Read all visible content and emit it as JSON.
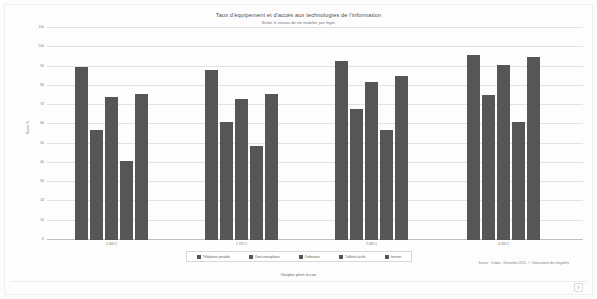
{
  "document": {
    "corner_mark_left": "·",
    "corner_mark_right": "·",
    "caption": "Graphe plein écran",
    "page_badge": "8"
  },
  "chart_data": {
    "type": "bar",
    "title": "Taux d'équipement et d'accès aux technologies de l'information",
    "subtitle": "Selon le niveau de vie mobilier par foyer",
    "xlabel": "",
    "ylabel": "Score %",
    "ylim": [
      0,
      110
    ],
    "ytick_step": 10,
    "yticks": [
      "110",
      "100",
      "90",
      "80",
      "70",
      "60",
      "50",
      "40",
      "30",
      "20",
      "10",
      "0"
    ],
    "grid": true,
    "legend_position": "bottom",
    "categories": [
      "1 000 €",
      "1 725 €",
      "2 635 €",
      "4 230 €"
    ],
    "series": [
      {
        "name": "Téléphone portable",
        "values": [
          90,
          88,
          93,
          96
        ]
      },
      {
        "name": "Dont smartphone",
        "values": [
          57,
          61,
          68,
          75
        ]
      },
      {
        "name": "Ordinateur",
        "values": [
          74,
          73,
          82,
          91
        ]
      },
      {
        "name": "Tablette tactile",
        "values": [
          41,
          49,
          57,
          61
        ]
      },
      {
        "name": "Internet",
        "values": [
          76,
          76,
          85,
          95
        ]
      }
    ],
    "source": "Source : Crédoc - Décembre 2015 - © Observatoire des inégalités"
  }
}
